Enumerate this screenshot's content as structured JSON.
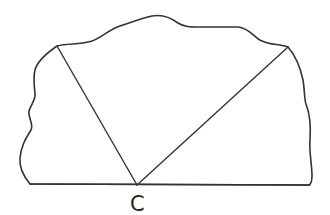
{
  "diagram": {
    "type": "geometry-figure",
    "points": {
      "C": {
        "label": "C",
        "x": 137,
        "y": 185
      },
      "upper_left_corner": {
        "x": 57,
        "y": 46
      },
      "upper_right_corner": {
        "x": 288,
        "y": 47
      },
      "base_left": {
        "x": 30,
        "y": 184
      },
      "base_right": {
        "x": 310,
        "y": 185
      }
    },
    "labels": {
      "vertex_c": "C"
    },
    "colors": {
      "stroke": "#333333",
      "background": "#ffffff"
    }
  }
}
